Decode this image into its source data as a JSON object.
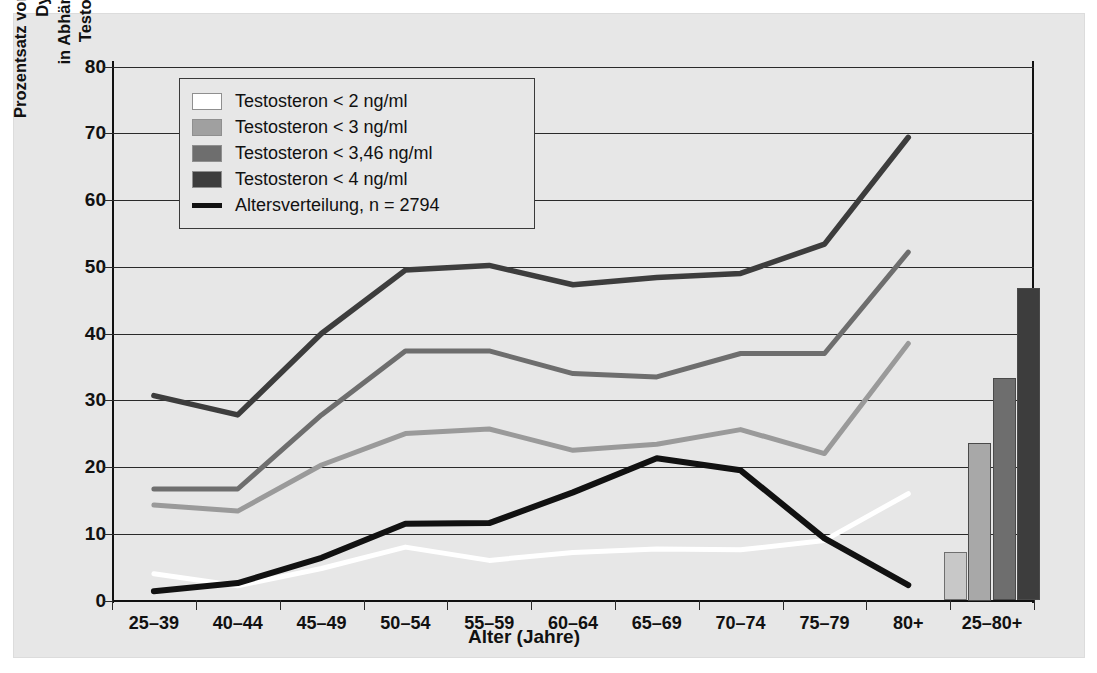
{
  "chart_data": {
    "type": "line",
    "title": "",
    "xlabel": "Alter (Jahre)",
    "ylabel_line1": "Prozentsatz von Männern mit erektiler Dysfunktion",
    "ylabel_line2": "in Abhängigkeit von den Testosteronwerten",
    "categories": [
      "25–39",
      "40–44",
      "45–49",
      "50–54",
      "55–59",
      "60–64",
      "65–69",
      "70–74",
      "75–79",
      "80+"
    ],
    "bar_category": "25–80+",
    "ylim": [
      0,
      80
    ],
    "yticks": [
      0,
      10,
      20,
      30,
      40,
      50,
      60,
      70,
      80
    ],
    "grid": true,
    "legend_position": "top-left",
    "series": [
      {
        "name": "Testosteron < 2 ng/ml",
        "color": "#ffffff",
        "values": [
          4.0,
          2.2,
          4.8,
          8.0,
          6.0,
          7.2,
          7.7,
          7.6,
          9.0,
          16.0
        ],
        "bar_value": 7.2
      },
      {
        "name": "Testosteron < 3 ng/ml",
        "color": "#9a9a9a",
        "values": [
          14.3,
          13.4,
          20.3,
          25.0,
          25.7,
          22.5,
          23.4,
          25.6,
          22.0,
          38.5
        ],
        "bar_value": 23.6
      },
      {
        "name": "Testosteron < 3,46 ng/ml",
        "color": "#6e6e6e",
        "values": [
          16.7,
          16.7,
          27.8,
          37.4,
          37.4,
          34.0,
          33.5,
          37.0,
          37.0,
          52.2
        ],
        "bar_value": 33.3
      },
      {
        "name": "Testosteron < 4 ng/ml",
        "color": "#3d3d3d",
        "values": [
          30.7,
          27.8,
          40.0,
          49.5,
          50.2,
          47.3,
          48.4,
          49.0,
          53.4,
          69.4
        ],
        "bar_value": 46.8
      },
      {
        "name": "Altersverteilung, n = 2794",
        "color": "#111111",
        "values": [
          1.4,
          2.6,
          6.4,
          11.5,
          11.6,
          16.2,
          21.3,
          19.5,
          9.3,
          2.3
        ],
        "bar_value": null
      }
    ],
    "bars": {
      "category_label": "25–80+",
      "values": [
        7.2,
        23.6,
        33.3,
        46.8
      ],
      "colors": [
        "#c8c8c8",
        "#a8a8a8",
        "#6e6e6e",
        "#3d3d3d"
      ],
      "labels": [
        "Testosteron < 2 ng/ml",
        "Testosteron < 3 ng/ml",
        "Testosteron < 3,46 ng/ml",
        "Testosteron < 4 ng/ml"
      ]
    },
    "legend_entries": [
      {
        "label": "Testosteron < 2 ng/ml",
        "swatch": "#ffffff",
        "kind": "swatch"
      },
      {
        "label": "Testosteron < 3 ng/ml",
        "swatch": "#a0a0a0",
        "kind": "swatch"
      },
      {
        "label": "Testosteron < 3,46 ng/ml",
        "swatch": "#6e6e6e",
        "kind": "swatch"
      },
      {
        "label": "Testosteron < 4 ng/ml",
        "swatch": "#3d3d3d",
        "kind": "swatch"
      },
      {
        "label": "Altersverteilung, n = 2794",
        "swatch": "#111111",
        "kind": "line"
      }
    ]
  },
  "axes": {
    "y_ticks": [
      "0",
      "10",
      "20",
      "30",
      "40",
      "50",
      "60",
      "70",
      "80"
    ],
    "x_ticks": [
      "25–39",
      "40–44",
      "45–49",
      "50–54",
      "55–59",
      "60–64",
      "65–69",
      "70–74",
      "75–79",
      "80+",
      "25–80+"
    ],
    "x_title": "Alter (Jahre)",
    "y_title_line1": "Prozentsatz von Männern mit erektiler Dysfunktion",
    "y_title_line2": "in Abhängigkeit von den Testosteronwerten"
  }
}
